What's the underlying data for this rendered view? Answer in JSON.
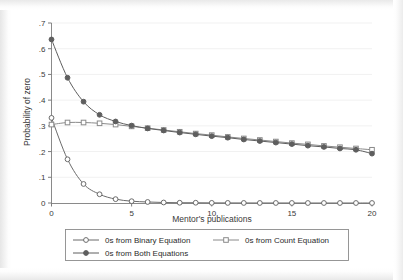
{
  "chart_data": {
    "type": "line",
    "title": "",
    "xlabel": "Mentor's publications",
    "ylabel": "Probability of zero",
    "xlim": [
      0,
      20
    ],
    "ylim": [
      0,
      0.7
    ],
    "xticks": [
      0,
      5,
      10,
      15,
      20
    ],
    "xtick_labels": [
      "0",
      "5",
      "10",
      "15",
      "20"
    ],
    "yticks": [
      0,
      0.1,
      0.2,
      0.3,
      0.4,
      0.5,
      0.6,
      0.7
    ],
    "ytick_labels": [
      "0",
      ".1",
      ".2",
      ".3",
      ".4",
      ".5",
      ".6",
      ".7"
    ],
    "grid": "horizontal-faint",
    "legend_position": "below",
    "x": [
      0,
      1,
      2,
      3,
      4,
      5,
      6,
      7,
      8,
      9,
      10,
      11,
      12,
      13,
      14,
      15,
      16,
      17,
      18,
      19,
      20
    ],
    "series": [
      {
        "name": "0s from Binary Equation",
        "marker": "open-circle",
        "color": "#6b6b6b",
        "values": [
          0.331,
          0.17,
          0.074,
          0.034,
          0.015,
          0.007,
          0.004,
          0.002,
          0.001,
          0.001,
          0.0005,
          0.0003,
          0.0002,
          0.0001,
          0.0001,
          0.0001,
          0.0,
          0.0,
          0.0,
          0.0,
          0.0
        ]
      },
      {
        "name": "0s from Count Equation",
        "marker": "open-square",
        "color": "#8a8a8a",
        "values": [
          0.305,
          0.313,
          0.313,
          0.31,
          0.305,
          0.298,
          0.291,
          0.284,
          0.277,
          0.27,
          0.264,
          0.257,
          0.251,
          0.245,
          0.239,
          0.233,
          0.228,
          0.222,
          0.217,
          0.212,
          0.207
        ]
      },
      {
        "name": "0s from Both Equations",
        "marker": "filled-circle",
        "color": "#5e5e5e",
        "values": [
          0.636,
          0.487,
          0.394,
          0.343,
          0.317,
          0.301,
          0.29,
          0.282,
          0.274,
          0.267,
          0.26,
          0.254,
          0.247,
          0.241,
          0.235,
          0.229,
          0.223,
          0.218,
          0.212,
          0.207,
          0.192
        ]
      }
    ]
  },
  "axes": {
    "x_title": "Mentor's publications",
    "y_title": "Probability of zero"
  },
  "legend": {
    "entries": [
      {
        "label": "0s from Binary Equation",
        "marker": "open-circle"
      },
      {
        "label": "0s from Count Equation",
        "marker": "open-square"
      },
      {
        "label": "0s from Both Equations",
        "marker": "filled-circle"
      }
    ]
  },
  "colors": {
    "line": "#6b6b6b",
    "axis": "#7d7d7d",
    "grid": "#f1f1f1",
    "text": "#333333",
    "legend_border": "#8c8c8c",
    "background": "#ffffff"
  }
}
